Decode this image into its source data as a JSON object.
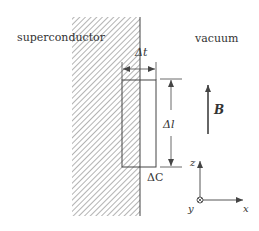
{
  "diagram": {
    "regions": {
      "left_label": "superconductor",
      "right_label": "vacuum"
    },
    "loop": {
      "width_label": "Δt",
      "length_label": "Δl",
      "contour_label": "ΔC"
    },
    "field": {
      "label": "B"
    },
    "axes": {
      "z_label": "z",
      "y_label": "y",
      "x_label": "x"
    },
    "colors": {
      "line": "#444444",
      "hatch": "#8a8a8a",
      "background": "#ffffff"
    }
  }
}
